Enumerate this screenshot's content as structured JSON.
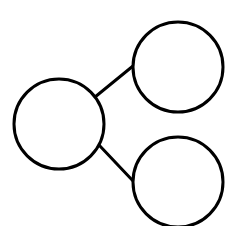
{
  "diagram": {
    "type": "tree",
    "background": "#ffffff",
    "stroke_color": "#000000",
    "stroke_width": 3,
    "nodes": [
      {
        "id": "root",
        "label": "",
        "cx": 59,
        "cy": 124,
        "r": 45
      },
      {
        "id": "child-top",
        "label": "",
        "cx": 178,
        "cy": 67,
        "r": 45
      },
      {
        "id": "child-bottom",
        "label": "",
        "cx": 178,
        "cy": 182,
        "r": 45
      }
    ],
    "edges": [
      {
        "from": "root",
        "to": "child-top",
        "x1": 95,
        "y1": 97,
        "x2": 133,
        "y2": 66
      },
      {
        "from": "root",
        "to": "child-bottom",
        "x1": 99,
        "y1": 145,
        "x2": 134,
        "y2": 182
      }
    ]
  }
}
